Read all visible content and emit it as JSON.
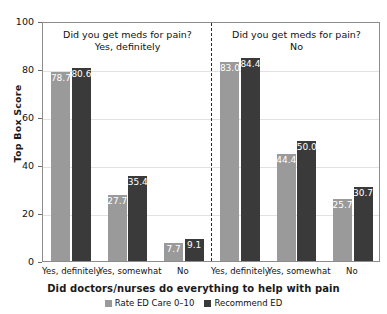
{
  "chart_data": {
    "type": "bar",
    "title": "",
    "subtitle": "",
    "xlabel": "Did doctors/nurses do everything to help with pain",
    "ylabel": "Top Box Score",
    "ylim": [
      0,
      100
    ],
    "yticks": [
      0,
      20,
      40,
      60,
      80,
      100
    ],
    "ytick_labels": [
      "0",
      "20",
      "40",
      "60",
      "80",
      "100"
    ],
    "grid": true,
    "legend_position": "bottom",
    "panels": [
      {
        "title": "Did you get meds for pain?\nYes, definitely",
        "categories": [
          "Yes, definitely",
          "Yes, somewhat",
          "No"
        ],
        "series": [
          {
            "name": "Rate ED Care 0–10",
            "values": [
              78.7,
              27.7,
              7.7
            ]
          },
          {
            "name": "Recommend ED",
            "values": [
              80.6,
              35.4,
              9.1
            ]
          }
        ]
      },
      {
        "title": "Did you get meds for pain?\nNo",
        "categories": [
          "Yes, definitely",
          "Yes, somewhat",
          "No"
        ],
        "series": [
          {
            "name": "Rate ED Care 0–10",
            "values": [
              83.0,
              44.4,
              25.7
            ]
          },
          {
            "name": "Recommend ED",
            "values": [
              84.4,
              50.0,
              30.7
            ]
          }
        ]
      }
    ],
    "series_colors": [
      "#9a9a9a",
      "#3a3a3a"
    ],
    "value_label_format": "one-decimal",
    "value_labels": [
      [
        "78.7",
        "80.6",
        "27.7",
        "35.4",
        "7.7",
        "9.1"
      ],
      [
        "83.0",
        "84.4",
        "44.4",
        "50.0",
        "25.7",
        "30.7"
      ]
    ]
  },
  "legend": {
    "items": [
      {
        "label": "Rate ED Care 0–10",
        "color": "#9a9a9a"
      },
      {
        "label": "Recommend ED",
        "color": "#3a3a3a"
      }
    ]
  }
}
